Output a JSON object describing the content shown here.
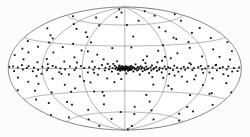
{
  "figure": {
    "projection_name": "Aitoff",
    "coordinate_system": "Galactic",
    "background_color": "#fdfdfd",
    "grid_color": "#6f6f6f",
    "boundary_color": "#555555",
    "point_color": "#0d0d0d"
  },
  "chart_data": {
    "type": "scatter",
    "subtitle": "",
    "projection": "aitoff",
    "coordinate_system": "galactic",
    "xlabel": "Galactic longitude l (deg)",
    "ylabel": "Galactic latitude b (deg)",
    "xlim": [
      -180,
      180
    ],
    "ylim": [
      -90,
      90
    ],
    "grid": true,
    "legend_position": "none",
    "annotations": [],
    "tick_labels": {
      "longitude": [],
      "latitude": []
    },
    "graticule": {
      "meridian_step_deg": 60,
      "meridians_deg": [
        -180,
        -120,
        -60,
        0,
        60,
        120,
        180
      ],
      "parallel_step_deg": 30,
      "parallels_deg": [
        -60,
        -30,
        0,
        30,
        60
      ]
    },
    "marker": {
      "shape": "square",
      "size_px": 1.8,
      "color": "#0d0d0d"
    },
    "series": [
      {
        "name": "sources",
        "n_points": 296,
        "points_lb": [
          [
            -178.0,
            1.5
          ],
          [
            -176.0,
            -21.0
          ],
          [
            -173.0,
            13.0
          ],
          [
            -171.0,
            2.0
          ],
          [
            -169.0,
            -2.5
          ],
          [
            -166.0,
            28.0
          ],
          [
            -164.0,
            -9.0
          ],
          [
            -162.0,
            1.0
          ],
          [
            -159.0,
            44.0
          ],
          [
            -157.0,
            -33.0
          ],
          [
            -155.0,
            3.5
          ],
          [
            -153.0,
            -1.0
          ],
          [
            -150.0,
            17.0
          ],
          [
            -148.0,
            -14.0
          ],
          [
            -146.0,
            0.5
          ],
          [
            -143.0,
            2.5
          ],
          [
            -141.0,
            -39.0
          ],
          [
            -139.0,
            24.0
          ],
          [
            -136.0,
            -3.0
          ],
          [
            -134.0,
            1.0
          ],
          [
            -132.0,
            -17.0
          ],
          [
            -129.0,
            7.0
          ],
          [
            -127.0,
            -1.5
          ],
          [
            -125.0,
            35.0
          ],
          [
            -122.0,
            -6.0
          ],
          [
            -120.0,
            2.0
          ],
          [
            -118.0,
            -28.0
          ],
          [
            -115.0,
            11.0
          ],
          [
            -113.0,
            -2.0
          ],
          [
            -111.0,
            0.5
          ],
          [
            -108.0,
            19.0
          ],
          [
            -106.0,
            -12.0
          ],
          [
            -104.0,
            3.0
          ],
          [
            -101.0,
            -45.0
          ],
          [
            -99.0,
            1.5
          ],
          [
            -97.0,
            26.0
          ],
          [
            -94.0,
            -4.5
          ],
          [
            -92.0,
            0.0
          ],
          [
            -90.0,
            -20.0
          ],
          [
            -87.0,
            8.5
          ],
          [
            -85.0,
            -1.0
          ],
          [
            -83.0,
            31.0
          ],
          [
            -80.0,
            -7.5
          ],
          [
            -78.0,
            2.5
          ],
          [
            -76.0,
            -25.0
          ],
          [
            -73.0,
            14.0
          ],
          [
            -71.0,
            -2.0
          ],
          [
            -69.0,
            1.0
          ],
          [
            -66.0,
            41.0
          ],
          [
            -64.0,
            -10.0
          ],
          [
            -62.0,
            3.0
          ],
          [
            -59.0,
            -16.0
          ],
          [
            -57.0,
            0.5
          ],
          [
            -55.0,
            22.0
          ],
          [
            -52.0,
            -5.0
          ],
          [
            -50.0,
            1.5
          ],
          [
            -48.0,
            -30.0
          ],
          [
            -46.0,
            9.0
          ],
          [
            -44.0,
            -1.5
          ],
          [
            -42.0,
            2.0
          ],
          [
            -40.0,
            18.0
          ],
          [
            -38.0,
            -8.0
          ],
          [
            -36.0,
            0.0
          ],
          [
            -34.0,
            -36.0
          ],
          [
            -32.0,
            4.5
          ],
          [
            -30.0,
            12.0
          ],
          [
            -28.0,
            -2.5
          ],
          [
            -27.0,
            1.0
          ],
          [
            -25.0,
            -13.0
          ],
          [
            -24.0,
            6.0
          ],
          [
            -22.0,
            -1.0
          ],
          [
            -21.0,
            2.5
          ],
          [
            -19.0,
            27.0
          ],
          [
            -18.0,
            -4.0
          ],
          [
            -17.0,
            0.5
          ],
          [
            -15.0,
            -18.0
          ],
          [
            -14.0,
            3.5
          ],
          [
            -13.0,
            -0.5
          ],
          [
            -12.0,
            1.5
          ],
          [
            -11.0,
            9.5
          ],
          [
            -10.0,
            -2.0
          ],
          [
            -9.5,
            0.0
          ],
          [
            -9.0,
            -7.0
          ],
          [
            -8.5,
            2.0
          ],
          [
            -8.0,
            -1.0
          ],
          [
            -7.5,
            4.0
          ],
          [
            -7.0,
            0.5
          ],
          [
            -6.5,
            -3.0
          ],
          [
            -6.0,
            1.0
          ],
          [
            -5.5,
            -0.5
          ],
          [
            -5.0,
            2.5
          ],
          [
            -4.5,
            -1.5
          ],
          [
            -4.0,
            0.0
          ],
          [
            -3.5,
            3.0
          ],
          [
            -3.0,
            -2.0
          ],
          [
            -2.5,
            1.0
          ],
          [
            -2.0,
            -0.5
          ],
          [
            -1.5,
            2.0
          ],
          [
            -1.0,
            0.5
          ],
          [
            -0.5,
            -1.0
          ],
          [
            0.0,
            1.5
          ],
          [
            0.5,
            -2.5
          ],
          [
            1.0,
            0.0
          ],
          [
            1.5,
            3.0
          ],
          [
            2.0,
            -1.0
          ],
          [
            2.5,
            1.0
          ],
          [
            3.0,
            -0.5
          ],
          [
            3.5,
            2.0
          ],
          [
            4.0,
            0.5
          ],
          [
            4.5,
            -3.0
          ],
          [
            5.0,
            1.5
          ],
          [
            5.5,
            -1.0
          ],
          [
            6.0,
            0.0
          ],
          [
            6.5,
            2.5
          ],
          [
            7.0,
            -2.0
          ],
          [
            7.5,
            1.0
          ],
          [
            8.0,
            -0.5
          ],
          [
            9.0,
            3.5
          ],
          [
            9.5,
            -1.5
          ],
          [
            10.0,
            0.5
          ],
          [
            11.0,
            2.0
          ],
          [
            12.0,
            -4.0
          ],
          [
            13.0,
            1.0
          ],
          [
            14.0,
            -1.0
          ],
          [
            15.0,
            5.5
          ],
          [
            16.0,
            0.0
          ],
          [
            17.0,
            -2.5
          ],
          [
            18.0,
            2.0
          ],
          [
            19.0,
            -1.5
          ],
          [
            20.0,
            1.0
          ],
          [
            21.0,
            -8.0
          ],
          [
            22.0,
            3.0
          ],
          [
            23.0,
            -0.5
          ],
          [
            24.0,
            1.5
          ],
          [
            25.0,
            -3.5
          ],
          [
            26.0,
            11.0
          ],
          [
            27.0,
            0.5
          ],
          [
            28.0,
            -2.0
          ],
          [
            30.0,
            2.5
          ],
          [
            31.0,
            -1.0
          ],
          [
            32.0,
            16.0
          ],
          [
            33.0,
            0.0
          ],
          [
            34.0,
            -6.0
          ],
          [
            36.0,
            1.5
          ],
          [
            37.0,
            -2.5
          ],
          [
            38.0,
            4.0
          ],
          [
            40.0,
            -1.0
          ],
          [
            41.0,
            0.5
          ],
          [
            42.0,
            -21.0
          ],
          [
            44.0,
            2.0
          ],
          [
            45.0,
            -3.0
          ],
          [
            46.0,
            8.0
          ],
          [
            48.0,
            -1.5
          ],
          [
            49.0,
            1.0
          ],
          [
            50.0,
            23.0
          ],
          [
            52.0,
            -5.0
          ],
          [
            53.0,
            0.0
          ],
          [
            55.0,
            -12.0
          ],
          [
            56.0,
            2.5
          ],
          [
            58.0,
            -1.0
          ],
          [
            60.0,
            30.0
          ],
          [
            61.0,
            1.5
          ],
          [
            63.0,
            -7.0
          ],
          [
            64.0,
            0.5
          ],
          [
            66.0,
            13.0
          ],
          [
            68.0,
            -2.0
          ],
          [
            70.0,
            3.5
          ],
          [
            72.0,
            -26.0
          ],
          [
            74.0,
            1.0
          ],
          [
            76.0,
            -4.0
          ],
          [
            78.0,
            19.0
          ],
          [
            80.0,
            0.0
          ],
          [
            82.0,
            -10.0
          ],
          [
            84.0,
            2.0
          ],
          [
            86.0,
            -1.5
          ],
          [
            88.0,
            37.0
          ],
          [
            90.0,
            1.0
          ],
          [
            92.0,
            -16.0
          ],
          [
            95.0,
            5.0
          ],
          [
            97.0,
            -2.0
          ],
          [
            99.0,
            0.5
          ],
          [
            101.0,
            25.0
          ],
          [
            103.0,
            -8.5
          ],
          [
            106.0,
            1.5
          ],
          [
            108.0,
            -32.0
          ],
          [
            110.0,
            3.0
          ],
          [
            112.0,
            -1.0
          ],
          [
            115.0,
            14.0
          ],
          [
            117.0,
            0.0
          ],
          [
            119.0,
            -19.0
          ],
          [
            122.0,
            2.5
          ],
          [
            124.0,
            -4.5
          ],
          [
            127.0,
            42.0
          ],
          [
            129.0,
            1.0
          ],
          [
            131.0,
            -11.0
          ],
          [
            134.0,
            3.5
          ],
          [
            136.0,
            -2.0
          ],
          [
            139.0,
            21.0
          ],
          [
            141.0,
            0.5
          ],
          [
            143.0,
            -27.0
          ],
          [
            146.0,
            1.5
          ],
          [
            148.0,
            -6.0
          ],
          [
            151.0,
            33.0
          ],
          [
            153.0,
            -1.0
          ],
          [
            156.0,
            2.0
          ],
          [
            158.0,
            -15.0
          ],
          [
            161.0,
            9.0
          ],
          [
            163.0,
            -3.0
          ],
          [
            166.0,
            0.5
          ],
          [
            168.0,
            -38.0
          ],
          [
            171.0,
            17.0
          ],
          [
            173.0,
            -2.5
          ],
          [
            176.0,
            1.0
          ],
          [
            178.0,
            -23.0
          ],
          [
            -160.0,
            62.0
          ],
          [
            -120.0,
            55.0
          ],
          [
            -95.0,
            68.0
          ],
          [
            -60.0,
            58.0
          ],
          [
            -30.0,
            72.0
          ],
          [
            5.0,
            60.0
          ],
          [
            40.0,
            66.0
          ],
          [
            75.0,
            54.0
          ],
          [
            110.0,
            70.0
          ],
          [
            145.0,
            57.0
          ],
          [
            170.0,
            64.0
          ],
          [
            -150.0,
            -58.0
          ],
          [
            -115.0,
            -66.0
          ],
          [
            -80.0,
            -54.0
          ],
          [
            -45.0,
            -70.0
          ],
          [
            -10.0,
            -60.0
          ],
          [
            25.0,
            -63.0
          ],
          [
            60.0,
            -56.0
          ],
          [
            95.0,
            -68.0
          ],
          [
            130.0,
            -55.0
          ],
          [
            165.0,
            -61.0
          ],
          [
            -140.0,
            -76.0
          ],
          [
            -20.0,
            80.0
          ],
          [
            55.0,
            -82.0
          ],
          [
            120.0,
            78.0
          ],
          [
            -70.0,
            85.0
          ],
          [
            100.0,
            -88.0
          ],
          [
            -135.0,
            38.0
          ],
          [
            -105.0,
            -41.0
          ],
          [
            -75.0,
            47.0
          ],
          [
            -40.0,
            -48.0
          ],
          [
            15.0,
            43.0
          ],
          [
            45.0,
            -44.0
          ],
          [
            85.0,
            39.0
          ],
          [
            125.0,
            -46.0
          ],
          [
            155.0,
            45.0
          ],
          [
            -175.0,
            -50.0
          ],
          [
            -55.0,
            34.0
          ],
          [
            35.0,
            -35.0
          ],
          [
            -165.0,
            20.0
          ],
          [
            -145.0,
            -24.0
          ],
          [
            -125.0,
            30.0
          ],
          [
            -85.0,
            -29.0
          ],
          [
            -65.0,
            23.0
          ],
          [
            -35.0,
            -31.0
          ],
          [
            10.0,
            28.0
          ],
          [
            65.0,
            -22.0
          ],
          [
            105.0,
            32.0
          ],
          [
            140.0,
            -28.0
          ],
          [
            175.0,
            26.0
          ],
          [
            -100.0,
            50.0
          ],
          [
            20.0,
            -52.0
          ],
          [
            80.0,
            48.0
          ],
          [
            150.0,
            -49.0
          ],
          [
            -50.0,
            -18.0
          ],
          [
            -5.0,
            -14.0
          ],
          [
            29.0,
            7.0
          ],
          [
            53.0,
            10.0
          ],
          [
            71.0,
            -9.0
          ],
          [
            93.0,
            6.5
          ],
          [
            114.0,
            -5.0
          ],
          [
            135.0,
            4.0
          ],
          [
            157.0,
            -7.5
          ],
          [
            -112.0,
            5.0
          ],
          [
            -91.0,
            -6.5
          ],
          [
            -68.0,
            7.5
          ],
          [
            -43.0,
            -5.5
          ],
          [
            -16.0,
            6.0
          ],
          [
            2.0,
            -6.5
          ],
          [
            39.0,
            -11.0
          ],
          [
            58.0,
            15.0
          ],
          [
            102.0,
            -13.0
          ],
          [
            144.0,
            12.5
          ],
          [
            -131.0,
            -8.5
          ],
          [
            -154.0,
            9.5
          ]
        ]
      }
    ]
  }
}
